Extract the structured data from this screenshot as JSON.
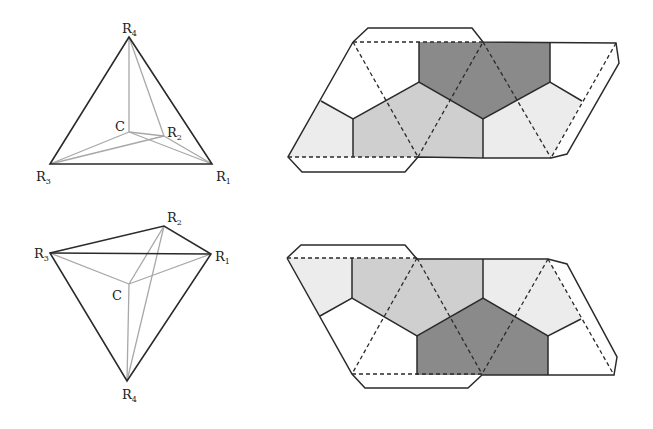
{
  "figure": {
    "colors": {
      "edge": "#2a2a2a",
      "inner_edge": "#9a9a9a",
      "light_fill": "#ececec",
      "mid_fill": "#cfcfcf",
      "dark_fill": "#8a8a8a"
    },
    "tetrahedra": [
      {
        "id": "top",
        "labels": {
          "R1": {
            "main": "R",
            "sub": "1"
          },
          "R2": {
            "main": "R",
            "sub": "2"
          },
          "R3": {
            "main": "R",
            "sub": "3"
          },
          "R4": {
            "main": "R",
            "sub": "4"
          },
          "C": "C"
        }
      },
      {
        "id": "bottom",
        "labels": {
          "R1": {
            "main": "R",
            "sub": "1"
          },
          "R2": {
            "main": "R",
            "sub": "2"
          },
          "R3": {
            "main": "R",
            "sub": "3"
          },
          "R4": {
            "main": "R",
            "sub": "4"
          },
          "C": "C"
        }
      }
    ],
    "nets": [
      {
        "id": "top-net",
        "description": "unfolded net with shaded Voronoi regions"
      },
      {
        "id": "bottom-net",
        "description": "unfolded net with shaded Voronoi regions"
      }
    ]
  }
}
